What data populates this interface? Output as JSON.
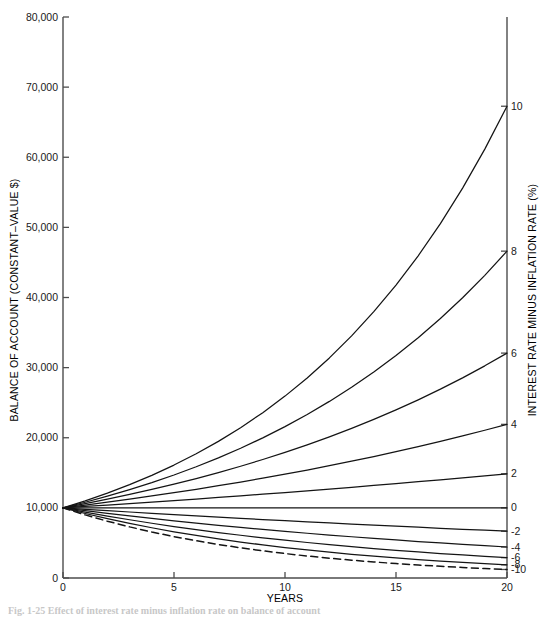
{
  "figure": {
    "background_color": "#ffffff",
    "line_color": "#141414",
    "axis_color": "#4d4d4d"
  },
  "axes": {
    "left_title": "BALANCE OF ACCOUNT (CONSTANT–VALUE $)",
    "right_title": "INTEREST RATE MINUS INFLATION RATE (%)",
    "bottom_title": "YEARS",
    "left_ticks": [
      "0",
      "10,000",
      "20,000",
      "30,000",
      "40,000",
      "50,000",
      "60,000",
      "70,000",
      "80,000"
    ],
    "bottom_ticks": [
      "0",
      "5",
      "10",
      "15",
      "20"
    ],
    "right_ticks": [
      "10",
      "8",
      "6",
      "4",
      "2",
      "0",
      "-2",
      "-4",
      "-6",
      "-8",
      "-10"
    ]
  },
  "caption": {
    "text": "Fig. 1-25  Effect of interest rate minus inflation rate on balance of account"
  },
  "chart_data": {
    "type": "line",
    "title": "",
    "subtitle": "",
    "xlabel": "YEARS",
    "ylabel": "BALANCE OF ACCOUNT (CONSTANT–VALUE $)",
    "y2label": "INTEREST RATE MINUS INFLATION RATE (%)",
    "xlim": [
      0,
      20
    ],
    "ylim": [
      0,
      80000
    ],
    "xticks": [
      0,
      5,
      10,
      15,
      20
    ],
    "yticks": [
      0,
      10000,
      20000,
      30000,
      40000,
      50000,
      60000,
      70000,
      80000
    ],
    "y2ticks": [
      10,
      8,
      6,
      4,
      2,
      0,
      -2,
      -4,
      -6,
      -8,
      -10
    ],
    "grid": false,
    "legend": "right-axis-endpoint-labels",
    "initial_balance": 10000,
    "x": [
      0,
      1,
      2,
      3,
      4,
      5,
      6,
      7,
      8,
      9,
      10,
      11,
      12,
      13,
      14,
      15,
      16,
      17,
      18,
      19,
      20
    ],
    "series": [
      {
        "name": "10",
        "rate_percent": 10,
        "style": "solid",
        "end_label": "10",
        "values": [
          10000,
          11000,
          12100,
          13310,
          14641,
          16105,
          17716,
          19487,
          21436,
          23579,
          25937,
          28531,
          31384,
          34523,
          37975,
          41772,
          45950,
          50545,
          55599,
          61159,
          67275
        ]
      },
      {
        "name": "8",
        "rate_percent": 8,
        "style": "solid",
        "end_label": "8",
        "values": [
          10000,
          10800,
          11664,
          12597,
          13605,
          14693,
          15869,
          17138,
          18509,
          19990,
          21589,
          23316,
          25182,
          27196,
          29372,
          31722,
          34259,
          37000,
          39960,
          43157,
          46610
        ]
      },
      {
        "name": "6",
        "rate_percent": 6,
        "style": "solid",
        "end_label": "6",
        "values": [
          10000,
          10600,
          11236,
          11910,
          12625,
          13382,
          14185,
          15036,
          15938,
          16895,
          17908,
          18983,
          20122,
          21329,
          22609,
          23966,
          25404,
          26928,
          28543,
          30256,
          32071
        ]
      },
      {
        "name": "4",
        "rate_percent": 4,
        "style": "solid",
        "end_label": "4",
        "values": [
          10000,
          10400,
          10816,
          11249,
          11699,
          12167,
          12653,
          13159,
          13686,
          14233,
          14802,
          15395,
          16010,
          16651,
          17317,
          18009,
          18730,
          19479,
          20258,
          21068,
          21911
        ]
      },
      {
        "name": "2",
        "rate_percent": 2,
        "style": "solid",
        "end_label": "2",
        "values": [
          10000,
          10200,
          10404,
          10612,
          10824,
          11041,
          11262,
          11487,
          11717,
          11951,
          12190,
          12434,
          12682,
          12936,
          13195,
          13459,
          13728,
          14002,
          14282,
          14568,
          14859
        ]
      },
      {
        "name": "0",
        "rate_percent": 0,
        "style": "solid",
        "end_label": "0",
        "values": [
          10000,
          10000,
          10000,
          10000,
          10000,
          10000,
          10000,
          10000,
          10000,
          10000,
          10000,
          10000,
          10000,
          10000,
          10000,
          10000,
          10000,
          10000,
          10000,
          10000,
          10000
        ]
      },
      {
        "name": "-2",
        "rate_percent": -2,
        "style": "solid",
        "end_label": "-2",
        "values": [
          10000,
          9800,
          9604,
          9412,
          9224,
          9039,
          8858,
          8681,
          8508,
          8337,
          8171,
          8007,
          7847,
          7690,
          7536,
          7386,
          7238,
          7093,
          6951,
          6812,
          6676
        ]
      },
      {
        "name": "-4",
        "rate_percent": -4,
        "style": "solid",
        "end_label": "-4",
        "values": [
          10000,
          9600,
          9216,
          8847,
          8493,
          8154,
          7828,
          7514,
          7214,
          6925,
          6648,
          6382,
          6127,
          5882,
          5647,
          5421,
          5204,
          4996,
          4796,
          4604,
          4420
        ]
      },
      {
        "name": "-6",
        "rate_percent": -6,
        "style": "solid",
        "end_label": "-6",
        "values": [
          10000,
          9400,
          8836,
          8306,
          7807,
          7339,
          6899,
          6485,
          6096,
          5730,
          5386,
          5063,
          4759,
          4474,
          4205,
          3953,
          3716,
          3493,
          3283,
          3086,
          2901
        ]
      },
      {
        "name": "-8",
        "rate_percent": -8,
        "style": "solid",
        "end_label": "-8",
        "values": [
          10000,
          9200,
          8464,
          7787,
          7164,
          6591,
          6064,
          5578,
          5132,
          4722,
          4344,
          3996,
          3677,
          3383,
          3112,
          2863,
          2634,
          2423,
          2229,
          2051,
          1887
        ]
      },
      {
        "name": "-10",
        "rate_percent": -10,
        "style": "dashed",
        "end_label": "-10",
        "values": [
          10000,
          9000,
          8100,
          7290,
          6561,
          5905,
          5314,
          4783,
          4305,
          3874,
          3487,
          3138,
          2824,
          2542,
          2288,
          2059,
          1853,
          1668,
          1501,
          1351,
          1216
        ]
      }
    ]
  }
}
